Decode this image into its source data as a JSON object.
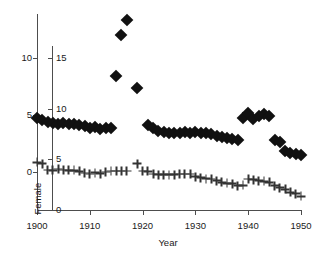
{
  "chart_data": {
    "type": "scatter",
    "title": "",
    "xlabel": "Year",
    "xlim": [
      1900,
      1950
    ],
    "xticks": [
      1900,
      1910,
      1920,
      1930,
      1940,
      1950
    ],
    "xticklabels": [
      "1900",
      "1910",
      "1920",
      "1930",
      "1940",
      "1950"
    ],
    "grid": false,
    "legend_position": "none",
    "axes": [
      {
        "id": "male",
        "label": "Male",
        "position": "left-outer",
        "ticks": [
          0,
          5,
          10
        ],
        "ticklabels": [
          "0",
          "5",
          "10"
        ],
        "lim": [
          0,
          11.6
        ],
        "marker": "filled-diamond",
        "color": "#111111"
      },
      {
        "id": "female",
        "label": "Female",
        "position": "left-inner",
        "ticks": [
          0,
          5,
          10,
          15
        ],
        "ticklabels": [
          "0",
          "5",
          "10",
          "15"
        ],
        "lim": [
          0,
          17.4
        ],
        "marker": "plus",
        "color": "#333333"
      }
    ],
    "series": [
      {
        "name": "Male",
        "axis": "male",
        "marker": "filled-diamond",
        "x": [
          1900,
          1901,
          1902,
          1903,
          1904,
          1905,
          1906,
          1907,
          1908,
          1909,
          1910,
          1911,
          1912,
          1913,
          1914,
          1915,
          1917,
          1919,
          1921,
          1922,
          1923,
          1924,
          1925,
          1926,
          1927,
          1928,
          1929,
          1930,
          1931,
          1932,
          1933,
          1934,
          1935,
          1936,
          1937,
          1938,
          1939,
          1940,
          1941,
          1942,
          1943,
          1944,
          1945,
          1946,
          1947,
          1948,
          1949,
          1950
        ],
        "y": [
          4.75,
          4.55,
          4.35,
          4.3,
          4.25,
          4.3,
          4.25,
          4.2,
          4.15,
          4.05,
          3.85,
          3.95,
          3.8,
          3.9,
          3.85,
          8.4,
          13.3,
          7.4,
          4.1,
          3.85,
          3.6,
          3.55,
          3.45,
          3.4,
          3.45,
          3.5,
          3.4,
          3.55,
          3.45,
          3.4,
          3.35,
          3.2,
          3.05,
          3.0,
          2.9,
          2.85,
          4.7,
          5.2,
          4.65,
          4.95,
          5.05,
          4.9,
          2.8,
          2.6,
          1.8,
          1.7,
          1.6,
          1.45
        ],
        "peak_year": 1917,
        "peak_value": 13.3,
        "second_peak_year": 1916,
        "second_peak_value": 12.0
      },
      {
        "name": "Female",
        "axis": "female",
        "marker": "plus",
        "x": [
          1900,
          1901,
          1902,
          1903,
          1904,
          1905,
          1906,
          1907,
          1908,
          1909,
          1910,
          1911,
          1912,
          1913,
          1914,
          1915,
          1916,
          1917,
          1919,
          1920,
          1921,
          1922,
          1923,
          1924,
          1925,
          1926,
          1927,
          1928,
          1929,
          1930,
          1931,
          1932,
          1933,
          1934,
          1935,
          1936,
          1937,
          1938,
          1939,
          1940,
          1941,
          1942,
          1943,
          1944,
          1945,
          1946,
          1947,
          1948,
          1949,
          1950
        ],
        "y": [
          4.7,
          4.55,
          3.95,
          3.9,
          4.05,
          3.95,
          3.9,
          3.9,
          3.8,
          3.65,
          3.55,
          3.7,
          3.6,
          3.75,
          3.85,
          3.85,
          3.85,
          3.85,
          4.55,
          3.85,
          3.8,
          3.55,
          3.5,
          3.5,
          3.5,
          3.5,
          3.55,
          3.55,
          3.55,
          3.3,
          3.2,
          3.1,
          3.05,
          2.9,
          2.75,
          2.65,
          2.6,
          2.4,
          2.45,
          3.05,
          3.0,
          2.9,
          2.85,
          2.75,
          2.4,
          2.2,
          2.05,
          1.75,
          1.6,
          1.35
        ]
      }
    ]
  },
  "axis": {
    "x": {
      "title": "Year",
      "ticklabels": [
        "1900",
        "1910",
        "1920",
        "1930",
        "1940",
        "1950"
      ]
    },
    "y_male": {
      "title": "Male",
      "ticklabels": [
        "0",
        "5",
        "10"
      ]
    },
    "y_female": {
      "title": "Female",
      "ticklabels": [
        "0",
        "5",
        "10",
        "15"
      ]
    }
  }
}
